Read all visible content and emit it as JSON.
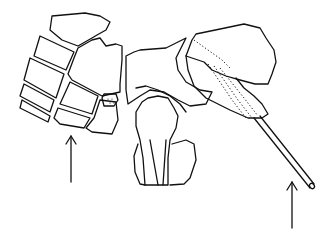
{
  "figure": {
    "arrows": [
      {
        "name": "left-arrow",
        "points_to": "lower bone blocks"
      },
      {
        "name": "right-arrow",
        "points_to": "pin tip"
      }
    ],
    "colors": {
      "line": "#111111",
      "background": "#ffffff"
    }
  }
}
